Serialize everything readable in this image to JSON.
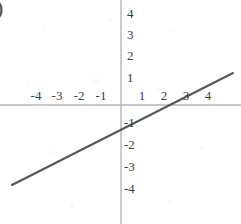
{
  "figure": {
    "width": 241,
    "height": 224,
    "background_color": "#ffffff",
    "corner_marker": ")"
  },
  "style": {
    "axis_color": "#b5b5b5",
    "line_color": "#555555",
    "label_color": "#3c3c3c",
    "line_width": 2,
    "axis_width": 1
  },
  "geometry": {
    "origin_x": 121,
    "origin_y": 105,
    "unit_px": 21.3,
    "line_start_x": 12,
    "line_start_y": 185,
    "line_end_x": 233,
    "line_end_y": 73
  },
  "chart_data": {
    "type": "line",
    "title": "",
    "xlabel": "",
    "ylabel": "",
    "xlim": [
      -5.7,
      5.6
    ],
    "ylim": [
      -5.6,
      4.9
    ],
    "grid": false,
    "legend": "none",
    "x_ticks": [
      -4,
      -3,
      -2,
      -1,
      1,
      2,
      3,
      4
    ],
    "x_tick_labels": [
      "-4",
      "-3",
      "-2",
      "-1",
      "1",
      "2",
      "3",
      "4"
    ],
    "y_ticks": [
      4,
      3,
      2,
      1,
      -1,
      -2,
      -3,
      -4
    ],
    "y_tick_labels": [
      "4",
      "3",
      "2",
      "1",
      "-1",
      "-2",
      "-3",
      "-4"
    ],
    "series": [
      {
        "name": "line",
        "equation": "y = x/3 - 1",
        "slope": 0.3333,
        "intercept": -1,
        "x_intercept": 3,
        "color": "#555555",
        "x": [
          -5.12,
          5.26
        ],
        "values": [
          -2.71,
          0.75
        ]
      }
    ],
    "annotations": []
  }
}
